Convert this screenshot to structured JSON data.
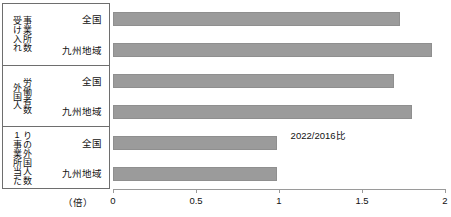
{
  "chart_data": {
    "type": "bar",
    "orientation": "horizontal",
    "title": "",
    "xlabel": "(倍)",
    "ylabel": "",
    "xlim": [
      0,
      2
    ],
    "xticks": [
      "0",
      "0.5",
      "1",
      "1.5",
      "2"
    ],
    "xtick_values": [
      0,
      0.5,
      1,
      1.5,
      2
    ],
    "grid": false,
    "legend": false,
    "annotation": "2022/2016比",
    "bar_color": "#9b9b9b",
    "groups": [
      {
        "label": "受け入れ\n事業所数",
        "label_lines": [
          "受け入れ",
          "事業所数"
        ],
        "rows": [
          {
            "label": "全国",
            "value": 1.73
          },
          {
            "label": "九州地域",
            "value": 1.92
          }
        ]
      },
      {
        "label": "外国人\n労働者数",
        "label_lines": [
          "外国人",
          "労働者数"
        ],
        "rows": [
          {
            "label": "全国",
            "value": 1.69
          },
          {
            "label": "九州地域",
            "value": 1.8
          }
        ]
      },
      {
        "label": "1事業所当た\nりの外国人数",
        "label_lines": [
          "1事業所当た",
          "りの外国人数"
        ],
        "rows": [
          {
            "label": "全国",
            "value": 0.99
          },
          {
            "label": "九州地域",
            "value": 0.99
          }
        ]
      }
    ],
    "categories": [
      "受け入れ事業所数 / 全国",
      "受け入れ事業所数 / 九州地域",
      "外国人労働者数 / 全国",
      "外国人労働者数 / 九州地域",
      "1事業所当たりの外国人数 / 全国",
      "1事業所当たりの外国人数 / 九州地域"
    ],
    "values": [
      1.73,
      1.92,
      1.69,
      1.8,
      0.99,
      0.99
    ]
  },
  "axis": {
    "unit": "（倍）",
    "ticks": [
      "0",
      "0.5",
      "1",
      "1.5",
      "2"
    ]
  },
  "table": {
    "groups": [
      {
        "vlabel_right": "受け入れ",
        "vlabel_left": "事業所数",
        "row1": "全国",
        "row2": "九州地域"
      },
      {
        "vlabel_right": "外国人",
        "vlabel_left": "労働者数",
        "row1": "全国",
        "row2": "九州地域"
      },
      {
        "vlabel_right": "1事業所当た",
        "vlabel_left": "りの外国人数",
        "row1": "全国",
        "row2": "九州地域"
      }
    ]
  },
  "annotation": {
    "text": "2022/2016比"
  }
}
